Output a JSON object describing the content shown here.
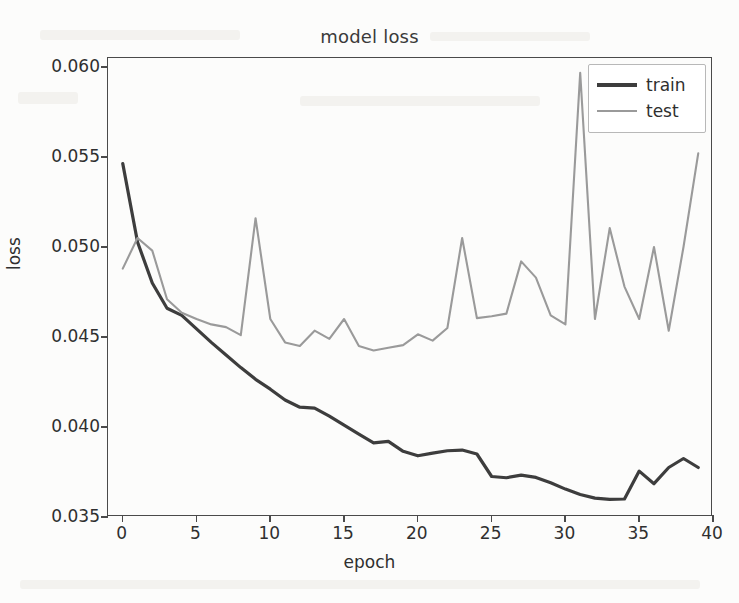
{
  "chart_data": {
    "type": "line",
    "title": "model loss",
    "xlabel": "epoch",
    "ylabel": "loss",
    "grid": false,
    "legend_position": "upper right",
    "xlim": [
      -1.0,
      40.0
    ],
    "ylim": [
      0.035,
      0.0605
    ],
    "xticks": [
      0,
      5,
      10,
      15,
      20,
      25,
      30,
      35,
      40
    ],
    "xtick_labels": [
      "0",
      "5",
      "10",
      "15",
      "20",
      "25",
      "30",
      "35",
      "40"
    ],
    "yticks": [
      0.035,
      0.04,
      0.045,
      0.05,
      0.055,
      0.06
    ],
    "ytick_labels": [
      "0.035",
      "0.040",
      "0.045",
      "0.050",
      "0.055",
      "0.060"
    ],
    "x": [
      0,
      1,
      2,
      3,
      4,
      5,
      6,
      7,
      8,
      9,
      10,
      11,
      12,
      13,
      14,
      15,
      16,
      17,
      18,
      19,
      20,
      21,
      22,
      23,
      24,
      25,
      26,
      27,
      28,
      29,
      30,
      31,
      32,
      33,
      34,
      35,
      36,
      37,
      38,
      39
    ],
    "series": [
      {
        "name": "train",
        "color": "#3d3d3d",
        "values": [
          0.05463,
          0.05028,
          0.048,
          0.0466,
          0.0462,
          0.04545,
          0.0447,
          0.044,
          0.0433,
          0.04265,
          0.0421,
          0.0415,
          0.0411,
          0.04105,
          0.0406,
          0.0401,
          0.0396,
          0.03912,
          0.0392,
          0.03865,
          0.0384,
          0.03855,
          0.03868,
          0.03872,
          0.0385,
          0.03725,
          0.03718,
          0.03733,
          0.0372,
          0.0369,
          0.03655,
          0.03625,
          0.03605,
          0.03598,
          0.036,
          0.03755,
          0.03685,
          0.03775,
          0.03825,
          0.03775
        ]
      },
      {
        "name": "test",
        "color": "#9a9a9a",
        "values": [
          0.0488,
          0.0505,
          0.0498,
          0.0471,
          0.04635,
          0.046,
          0.0457,
          0.04555,
          0.0451,
          0.0516,
          0.046,
          0.0447,
          0.0445,
          0.04535,
          0.0449,
          0.046,
          0.0445,
          0.04425,
          0.0444,
          0.04455,
          0.04515,
          0.0448,
          0.0455,
          0.0505,
          0.04605,
          0.04615,
          0.0463,
          0.0492,
          0.0483,
          0.0462,
          0.0457,
          0.05968,
          0.046,
          0.05105,
          0.0478,
          0.046,
          0.05,
          0.04535,
          0.05,
          0.0552
        ]
      }
    ],
    "annotations": [
      {
        "label": "spike at epoch 9",
        "x": 9,
        "y": 0.0516
      },
      {
        "label": "spike at epoch 23",
        "x": 23,
        "y": 0.0505
      },
      {
        "label": "max spike at epoch 31",
        "x": 31,
        "y": 0.0597
      }
    ]
  },
  "legend": {
    "entries": [
      {
        "label": "train",
        "icon": "line-swatch-icon"
      },
      {
        "label": "test",
        "icon": "line-swatch-icon"
      }
    ]
  }
}
